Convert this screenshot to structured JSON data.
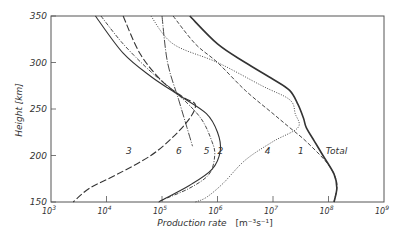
{
  "chart_data": {
    "type": "line",
    "title": "",
    "xlabel": "Production rate [m⁻³s⁻¹]",
    "ylabel": "Height [km]",
    "xscale": "log",
    "xlim_log10": [
      3,
      9
    ],
    "ylim": [
      150,
      350
    ],
    "x_ticks": [
      "10^3",
      "10^4",
      "10^5",
      "10^6",
      "10^7",
      "10^8",
      "10^9"
    ],
    "y_ticks": [
      150,
      200,
      250,
      300,
      350
    ],
    "grid": false,
    "legend": "inline curve labels",
    "series": [
      {
        "name": "Total",
        "style": "solid-thick",
        "points_log10x_height": [
          [
            5.5,
            350
          ],
          [
            6.0,
            320
          ],
          [
            6.5,
            300
          ],
          [
            7.0,
            282
          ],
          [
            7.3,
            270
          ],
          [
            7.45,
            255
          ],
          [
            7.55,
            240
          ],
          [
            7.6,
            230
          ],
          [
            7.75,
            215
          ],
          [
            7.9,
            200
          ],
          [
            8.1,
            180
          ],
          [
            8.15,
            165
          ],
          [
            8.1,
            150
          ]
        ]
      },
      {
        "name": "1",
        "style": "dashed",
        "points_log10x_height": [
          [
            5.2,
            350
          ],
          [
            5.6,
            320
          ],
          [
            6.0,
            300
          ],
          [
            6.5,
            270
          ],
          [
            7.0,
            245
          ],
          [
            7.3,
            230
          ],
          [
            7.6,
            215
          ],
          [
            8.0,
            190
          ],
          [
            8.15,
            170
          ],
          [
            8.1,
            150
          ]
        ]
      },
      {
        "name": "2",
        "style": "dash-dot",
        "points_log10x_height": [
          [
            3.9,
            350
          ],
          [
            4.3,
            320
          ],
          [
            4.8,
            290
          ],
          [
            5.3,
            265
          ],
          [
            5.7,
            240
          ],
          [
            5.9,
            215
          ],
          [
            5.95,
            200
          ],
          [
            5.85,
            180
          ],
          [
            5.5,
            165
          ],
          [
            5.0,
            152
          ],
          [
            4.95,
            150
          ]
        ]
      },
      {
        "name": "3",
        "style": "long-dash",
        "points_log10x_height": [
          [
            4.3,
            350
          ],
          [
            4.6,
            310
          ],
          [
            5.0,
            280
          ],
          [
            5.4,
            262
          ],
          [
            5.6,
            255
          ],
          [
            5.5,
            240
          ],
          [
            5.2,
            220
          ],
          [
            4.8,
            200
          ],
          [
            4.2,
            180
          ],
          [
            3.7,
            165
          ],
          [
            3.4,
            150
          ]
        ]
      },
      {
        "name": "4",
        "style": "dotted",
        "points_log10x_height": [
          [
            4.8,
            350
          ],
          [
            5.2,
            320
          ],
          [
            6.0,
            300
          ],
          [
            6.8,
            275
          ],
          [
            7.3,
            260
          ],
          [
            7.4,
            245
          ],
          [
            7.45,
            230
          ],
          [
            7.0,
            215
          ],
          [
            6.5,
            195
          ],
          [
            6.1,
            170
          ],
          [
            5.8,
            155
          ],
          [
            5.6,
            150
          ]
        ]
      },
      {
        "name": "5",
        "style": "solid",
        "points_log10x_height": [
          [
            3.8,
            350
          ],
          [
            4.3,
            310
          ],
          [
            4.8,
            285
          ],
          [
            5.3,
            265
          ],
          [
            5.8,
            245
          ],
          [
            6.0,
            225
          ],
          [
            6.05,
            205
          ],
          [
            5.9,
            185
          ],
          [
            5.5,
            168
          ],
          [
            5.0,
            152
          ],
          [
            4.95,
            150
          ]
        ]
      },
      {
        "name": "6",
        "style": "dash-dot-long",
        "points_log10x_height": [
          [
            5.0,
            350
          ],
          [
            5.1,
            300
          ],
          [
            5.3,
            260
          ],
          [
            5.45,
            230
          ],
          [
            5.55,
            210
          ]
        ]
      }
    ],
    "annotations": [
      {
        "text": "3",
        "log10x": 4.35,
        "height": 205
      },
      {
        "text": "6",
        "log10x": 5.25,
        "height": 205
      },
      {
        "text": "5",
        "log10x": 5.75,
        "height": 205
      },
      {
        "text": "2",
        "log10x": 6.0,
        "height": 205
      },
      {
        "text": "4",
        "log10x": 6.85,
        "height": 205
      },
      {
        "text": "1",
        "log10x": 7.45,
        "height": 205
      },
      {
        "text": "Total",
        "log10x": 7.95,
        "height": 205
      }
    ]
  },
  "axes": {
    "y_label": "Height [km]",
    "x_label_main": "Production rate",
    "x_label_unit": "[m⁻³s⁻¹]",
    "y_tick_labels": [
      "150",
      "200",
      "250",
      "300",
      "350"
    ],
    "x_tick_labels": [
      "10",
      "10",
      "10",
      "10",
      "10",
      "10",
      "10"
    ],
    "x_tick_exponents": [
      "3",
      "4",
      "5",
      "6",
      "7",
      "8",
      "9"
    ]
  },
  "curve_labels": [
    "3",
    "6",
    "5",
    "2",
    "4",
    "1",
    "Total"
  ]
}
